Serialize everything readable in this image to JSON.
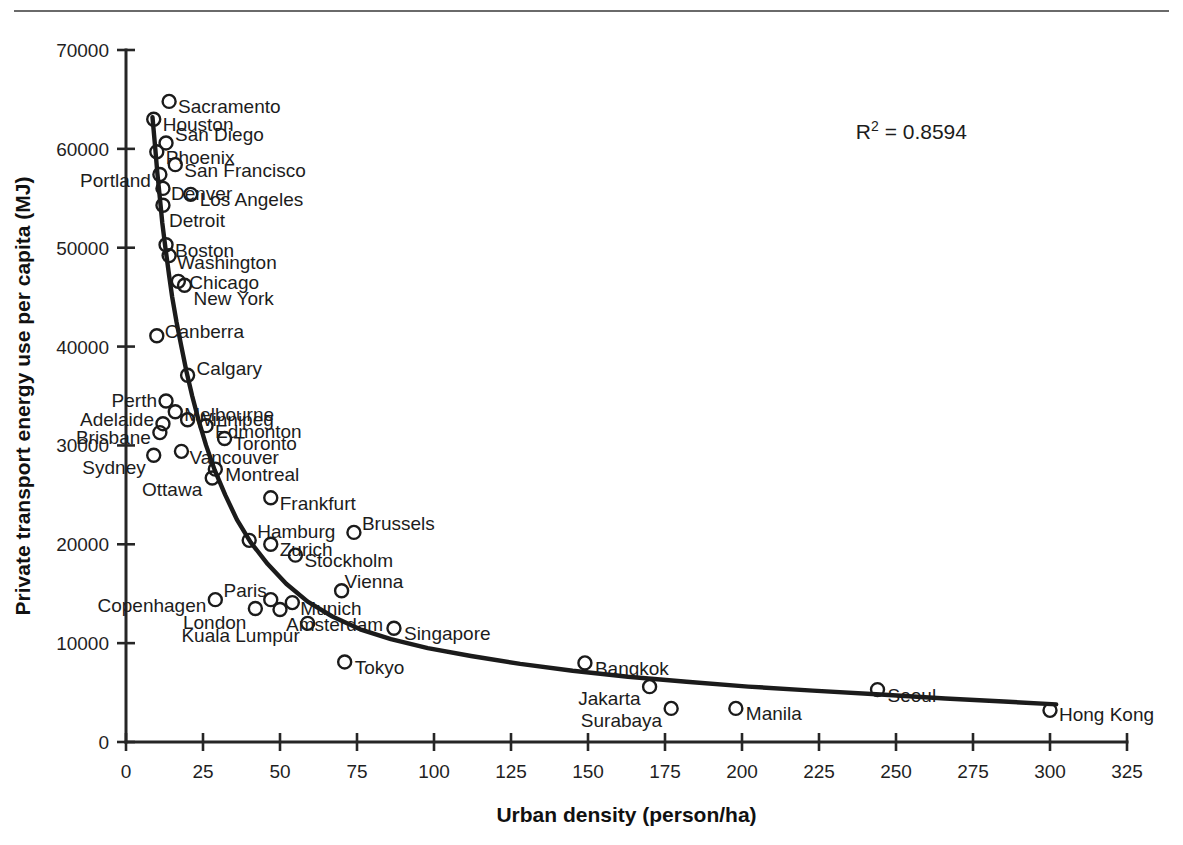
{
  "figure": {
    "annotation": "R² = 0.8594",
    "annotation_base": "R",
    "annotation_sup": "2",
    "annotation_rest": " = 0.8594"
  },
  "chart_data": {
    "type": "scatter",
    "title": "",
    "xlabel": "Urban density (person/ha)",
    "ylabel": "Private transport energy use per capita (MJ)",
    "xlim": [
      0,
      325
    ],
    "ylim": [
      0,
      70000
    ],
    "xticks": [
      0,
      25,
      50,
      75,
      100,
      125,
      150,
      175,
      200,
      225,
      250,
      275,
      300,
      325
    ],
    "yticks": [
      0,
      10000,
      20000,
      30000,
      40000,
      50000,
      60000,
      70000
    ],
    "xtick_labels": [
      "0",
      "25",
      "50",
      "75",
      "100",
      "125",
      "150",
      "175",
      "200",
      "225",
      "250",
      "275",
      "300",
      "325"
    ],
    "ytick_labels": [
      "0",
      "10000",
      "20000",
      "30000",
      "40000",
      "50000",
      "60000",
      "70000"
    ],
    "grid": false,
    "legend": false,
    "annotations": [
      {
        "text": "R² = 0.8594",
        "x": 255,
        "y": 61000
      }
    ],
    "marker": "open-circle",
    "points": [
      {
        "label": "Sacramento",
        "x": 14,
        "y": 64800,
        "label_dx": 9,
        "label_dy": 6
      },
      {
        "label": "Houston",
        "x": 9,
        "y": 63000,
        "label_dx": 9,
        "label_dy": 6
      },
      {
        "label": "San Diego",
        "x": 13,
        "y": 60600,
        "label_dx": 9,
        "label_dy": -8
      },
      {
        "label": "Phoenix",
        "x": 10,
        "y": 59700,
        "label_dx": 9,
        "label_dy": 6
      },
      {
        "label": "San Francisco",
        "x": 16,
        "y": 58400,
        "label_dx": 9,
        "label_dy": 6
      },
      {
        "label": "Portland",
        "x": 11,
        "y": 57400,
        "label_dx": -9,
        "label_dy": 6,
        "label_anchor": "end"
      },
      {
        "label": "Denver",
        "x": 12,
        "y": 56000,
        "label_dx": 8,
        "label_dy": 6
      },
      {
        "label": "Los Angeles",
        "x": 21,
        "y": 55400,
        "label_dx": 9,
        "label_dy": 6
      },
      {
        "label": "Detroit",
        "x": 12,
        "y": 54300,
        "label_dx": 6,
        "label_dy": 16
      },
      {
        "label": "Boston",
        "x": 13,
        "y": 50300,
        "label_dx": 9,
        "label_dy": 6
      },
      {
        "label": "Washington",
        "x": 14,
        "y": 49200,
        "label_dx": 8,
        "label_dy": 7
      },
      {
        "label": "Chicago",
        "x": 17,
        "y": 46600,
        "label_dx": 11,
        "label_dy": 2
      },
      {
        "label": "New York",
        "x": 19,
        "y": 46200,
        "label_dx": 9,
        "label_dy": 14
      },
      {
        "label": "Canberra",
        "x": 10,
        "y": 41100,
        "label_dx": 8,
        "label_dy": -4
      },
      {
        "label": "Calgary",
        "x": 20,
        "y": 37100,
        "label_dx": 9,
        "label_dy": -6
      },
      {
        "label": "Perth",
        "x": 13,
        "y": 34500,
        "label_dx": -9,
        "label_dy": 0,
        "label_anchor": "end"
      },
      {
        "label": "Melbourne",
        "x": 16,
        "y": 33400,
        "label_dx": 9,
        "label_dy": 3
      },
      {
        "label": "Winnipeg",
        "x": 20,
        "y": 32600,
        "label_dx": 7,
        "label_dy": 0
      },
      {
        "label": "Adelaide",
        "x": 12,
        "y": 32200,
        "label_dx": -9,
        "label_dy": -4,
        "label_anchor": "end"
      },
      {
        "label": "Edmonton",
        "x": 26,
        "y": 32000,
        "label_dx": 9,
        "label_dy": 6
      },
      {
        "label": "Brisbane",
        "x": 11,
        "y": 31300,
        "label_dx": -9,
        "label_dy": 5,
        "label_anchor": "end"
      },
      {
        "label": "Toronto",
        "x": 32,
        "y": 30700,
        "label_dx": 9,
        "label_dy": 5
      },
      {
        "label": "Vancouver",
        "x": 18,
        "y": 29400,
        "label_dx": 8,
        "label_dy": 7
      },
      {
        "label": "Sydney",
        "x": 9,
        "y": 29000,
        "label_dx": -8,
        "label_dy": 13,
        "label_anchor": "end"
      },
      {
        "label": "Montreal",
        "x": 29,
        "y": 27600,
        "label_dx": 10,
        "label_dy": 6
      },
      {
        "label": "Ottawa",
        "x": 28,
        "y": 26700,
        "label_dx": -10,
        "label_dy": 12,
        "label_anchor": "end"
      },
      {
        "label": "Frankfurt",
        "x": 47,
        "y": 24700,
        "label_dx": 9,
        "label_dy": 6
      },
      {
        "label": "Brussels",
        "x": 74,
        "y": 21200,
        "label_dx": 8,
        "label_dy": -8
      },
      {
        "label": "Hamburg",
        "x": 40,
        "y": 20400,
        "label_dx": 8,
        "label_dy": -8
      },
      {
        "label": "Zurich",
        "x": 47,
        "y": 20000,
        "label_dx": 9,
        "label_dy": 6
      },
      {
        "label": "Stockholm",
        "x": 55,
        "y": 18900,
        "label_dx": 9,
        "label_dy": 6
      },
      {
        "label": "Vienna",
        "x": 70,
        "y": 15300,
        "label_dx": 3,
        "label_dy": -9
      },
      {
        "label": "Paris",
        "x": 47,
        "y": 14400,
        "label_dx": -4,
        "label_dy": -9,
        "label_anchor": "end"
      },
      {
        "label": "Copenhagen",
        "x": 29,
        "y": 14400,
        "label_dx": -9,
        "label_dy": 6,
        "label_anchor": "end"
      },
      {
        "label": "Munich",
        "x": 54,
        "y": 14100,
        "label_dx": 8,
        "label_dy": 6
      },
      {
        "label": "London",
        "x": 42,
        "y": 13500,
        "label_dx": -9,
        "label_dy": 14,
        "label_anchor": "end"
      },
      {
        "label": "Amsterdam",
        "x": 50,
        "y": 13400,
        "label_dx": 6,
        "label_dy": 15
      },
      {
        "label": "Kuala Lumpur",
        "x": 59,
        "y": 12000,
        "label_dx": -8,
        "label_dy": 13,
        "label_anchor": "end"
      },
      {
        "label": "Singapore",
        "x": 87,
        "y": 11500,
        "label_dx": 10,
        "label_dy": 6
      },
      {
        "label": "Tokyo",
        "x": 71,
        "y": 8100,
        "label_dx": 10,
        "label_dy": 6
      },
      {
        "label": "Bangkok",
        "x": 149,
        "y": 8000,
        "label_dx": 10,
        "label_dy": 6
      },
      {
        "label": "Jakarta",
        "x": 170,
        "y": 5600,
        "label_dx": -9,
        "label_dy": 12,
        "label_anchor": "end"
      },
      {
        "label": "Seoul",
        "x": 244,
        "y": 5300,
        "label_dx": 10,
        "label_dy": 6
      },
      {
        "label": "Surabaya",
        "x": 177,
        "y": 3400,
        "label_dx": -9,
        "label_dy": 13,
        "label_anchor": "end"
      },
      {
        "label": "Manila",
        "x": 198,
        "y": 3400,
        "label_dx": 10,
        "label_dy": 6
      },
      {
        "label": "Hong Kong",
        "x": 300,
        "y": 3200,
        "label_dx": 9,
        "label_dy": 5
      }
    ],
    "trend": {
      "kind": "power",
      "description": "decreasing power-law fit through the cloud",
      "r_squared": 0.8594,
      "curve": [
        {
          "x": 8.6,
          "y": 63200
        },
        {
          "x": 9.5,
          "y": 60000
        },
        {
          "x": 10.2,
          "y": 57500
        },
        {
          "x": 11.0,
          "y": 55000
        },
        {
          "x": 11.8,
          "y": 52500
        },
        {
          "x": 12.8,
          "y": 50000
        },
        {
          "x": 14.0,
          "y": 47200
        },
        {
          "x": 15.0,
          "y": 45000
        },
        {
          "x": 16.4,
          "y": 42500
        },
        {
          "x": 18.0,
          "y": 40000
        },
        {
          "x": 19.6,
          "y": 37500
        },
        {
          "x": 21.5,
          "y": 35000
        },
        {
          "x": 23.6,
          "y": 32500
        },
        {
          "x": 26.0,
          "y": 30000
        },
        {
          "x": 28.8,
          "y": 27500
        },
        {
          "x": 32.2,
          "y": 25000
        },
        {
          "x": 36.0,
          "y": 22500
        },
        {
          "x": 40.5,
          "y": 20200
        },
        {
          "x": 46.0,
          "y": 18000
        },
        {
          "x": 52.0,
          "y": 16000
        },
        {
          "x": 59.0,
          "y": 14200
        },
        {
          "x": 67.0,
          "y": 12700
        },
        {
          "x": 76.0,
          "y": 11400
        },
        {
          "x": 86.0,
          "y": 10400
        },
        {
          "x": 98.0,
          "y": 9500
        },
        {
          "x": 112.0,
          "y": 8700
        },
        {
          "x": 128.0,
          "y": 7900
        },
        {
          "x": 145.0,
          "y": 7200
        },
        {
          "x": 163.0,
          "y": 6600
        },
        {
          "x": 182.0,
          "y": 6100
        },
        {
          "x": 202.0,
          "y": 5600
        },
        {
          "x": 223.0,
          "y": 5200
        },
        {
          "x": 245.0,
          "y": 4800
        },
        {
          "x": 266.0,
          "y": 4400
        },
        {
          "x": 285.0,
          "y": 4100
        },
        {
          "x": 302.0,
          "y": 3800
        }
      ]
    }
  }
}
